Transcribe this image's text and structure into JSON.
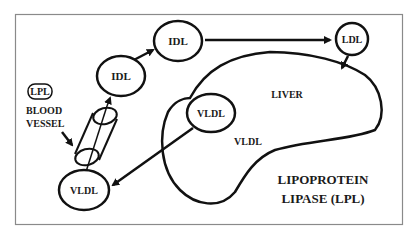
{
  "diagram": {
    "title_line1": "LIPOPROTEIN",
    "title_line2": "LIPASE (LPL)",
    "nodes": {
      "idl_upper": "IDL",
      "idl_lower": "IDL",
      "ldl": "LDL",
      "vldl_liver": "VLDL",
      "vldl_blood": "VLDL"
    },
    "labels": {
      "liver": "LIVER",
      "vldl_region": "VLDL",
      "lpl_badge": "LPL",
      "blood_vessel_line1": "BLOOD",
      "blood_vessel_line2": "VESSEL"
    },
    "colors": {
      "stroke": "#111111",
      "frame": "#8a8a8a",
      "background": "#ffffff"
    }
  }
}
